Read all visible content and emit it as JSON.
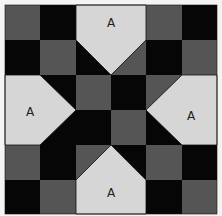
{
  "diagram": {
    "type": "quilt-block",
    "grid": {
      "rows": 6,
      "cols": 6
    },
    "colors": {
      "background": "#f4f4f4",
      "light": "#d6d6d6",
      "gray": "#555555",
      "black": "#060606",
      "outline": "#111111"
    },
    "cells": [
      [
        "gray",
        "black",
        "A-top",
        "A-top",
        "gray",
        "black"
      ],
      [
        "black",
        "gray",
        "tri-black-gray",
        "tri-gray",
        "black",
        "gray"
      ],
      [
        "A-left",
        "tri-black",
        "gray",
        "black",
        "tri-gray",
        "A-right"
      ],
      [
        "A-left",
        "tri-gray",
        "black",
        "gray",
        "tri-black",
        "A-right"
      ],
      [
        "gray",
        "black",
        "tri-gray",
        "tri-black",
        "gray",
        "black"
      ],
      [
        "black",
        "gray",
        "A-bottom",
        "A-bottom",
        "black",
        "gray"
      ]
    ],
    "patches": [
      {
        "id": "top",
        "label": "A"
      },
      {
        "id": "left",
        "label": "A"
      },
      {
        "id": "right",
        "label": "A"
      },
      {
        "id": "bottom",
        "label": "A"
      }
    ]
  }
}
